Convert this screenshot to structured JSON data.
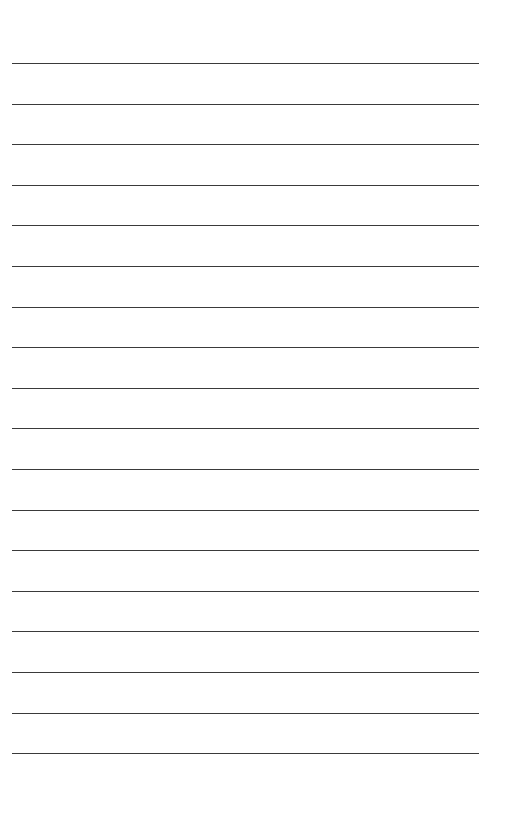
{
  "page": {
    "type": "lined-paper",
    "line_count": 18,
    "first_line_y": 63,
    "line_spacing": 40.6,
    "line_left": 12,
    "line_width": 467,
    "line_color": "#3a3a3a",
    "background_color": "#ffffff"
  }
}
